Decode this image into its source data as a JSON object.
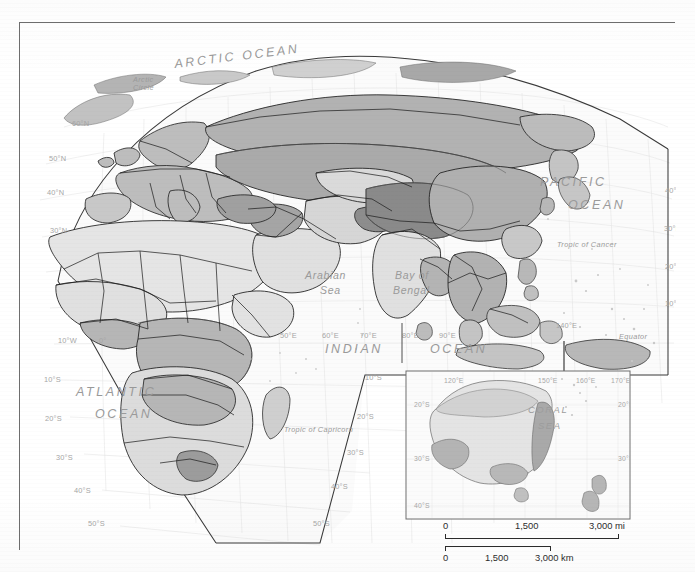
{
  "map": {
    "title": "",
    "projection_note": "",
    "frame": {
      "border_color": "#6e6e6e"
    },
    "ocean_labels": [
      {
        "id": "arctic-ocean",
        "text": "ARCTIC  OCEAN",
        "x": 155,
        "y": 45,
        "class": "ocean-major",
        "rotate": -7
      },
      {
        "id": "arctic-circle",
        "text": "Arctic",
        "x": 113,
        "y": 59,
        "class": "ocean-small",
        "rotate": 0
      },
      {
        "id": "arctic-circle2",
        "text": "Circle",
        "x": 113,
        "y": 67,
        "class": "ocean-small",
        "rotate": 0
      },
      {
        "id": "pacific-ocean",
        "text": "PACIFIC",
        "x": 520,
        "y": 163,
        "class": "ocean-major",
        "rotate": 0
      },
      {
        "id": "pacific-ocean2",
        "text": "OCEAN",
        "x": 548,
        "y": 186,
        "class": "ocean-major",
        "rotate": 0
      },
      {
        "id": "arabian-sea",
        "text": "Arabian",
        "x": 285,
        "y": 256,
        "class": "ocean-sea",
        "rotate": 0
      },
      {
        "id": "arabian-sea2",
        "text": "Sea",
        "x": 300,
        "y": 271,
        "class": "ocean-sea",
        "rotate": 0
      },
      {
        "id": "bay-of-bengal",
        "text": "Bay of",
        "x": 375,
        "y": 256,
        "class": "ocean-sea",
        "rotate": 0
      },
      {
        "id": "bay-of-bengal2",
        "text": "Bengal",
        "x": 373,
        "y": 271,
        "class": "ocean-sea",
        "rotate": 0
      },
      {
        "id": "indian-ocean",
        "text": "INDIAN",
        "x": 305,
        "y": 330,
        "class": "ocean-major",
        "rotate": 0
      },
      {
        "id": "indian-ocean2",
        "text": "OCEAN",
        "x": 410,
        "y": 330,
        "class": "ocean-major",
        "rotate": 0
      },
      {
        "id": "atlantic-ocean",
        "text": "ATLANTIC",
        "x": 56,
        "y": 373,
        "class": "ocean-major",
        "rotate": 0
      },
      {
        "id": "atlantic-ocean2",
        "text": "OCEAN",
        "x": 75,
        "y": 395,
        "class": "ocean-major",
        "rotate": 0
      },
      {
        "id": "tropic-of-cancer",
        "text": "Tropic of Cancer",
        "x": 537,
        "y": 224,
        "class": "ocean-small",
        "rotate": 0
      },
      {
        "id": "tropic-of-capricorn",
        "text": "Tropic of Capricorn",
        "x": 264,
        "y": 409,
        "class": "ocean-small",
        "rotate": 0
      },
      {
        "id": "equator",
        "text": "Equator",
        "x": 599,
        "y": 316,
        "class": "ocean-small",
        "rotate": 0
      }
    ],
    "latitude_labels_left": [
      {
        "text": "60°N",
        "x": 52,
        "y": 103
      },
      {
        "text": "50°N",
        "x": 29,
        "y": 138
      },
      {
        "text": "40°N",
        "x": 27,
        "y": 172
      },
      {
        "text": "30°N",
        "x": 30,
        "y": 210
      },
      {
        "text": "10°S",
        "x": 24,
        "y": 359
      },
      {
        "text": "20°S",
        "x": 25,
        "y": 398
      },
      {
        "text": "30°S",
        "x": 36,
        "y": 437
      },
      {
        "text": "40°S",
        "x": 54,
        "y": 470
      },
      {
        "text": "50°S",
        "x": 68,
        "y": 503
      }
    ],
    "latitude_labels_mid": [
      {
        "text": "10°S",
        "x": 345,
        "y": 357
      },
      {
        "text": "20°S",
        "x": 337,
        "y": 396
      },
      {
        "text": "30°S",
        "x": 327,
        "y": 432
      },
      {
        "text": "40°S",
        "x": 311,
        "y": 466
      },
      {
        "text": "50°S",
        "x": 293,
        "y": 503
      }
    ],
    "latitude_labels_right": [
      {
        "text": "40°N",
        "x": 645,
        "y": 170
      },
      {
        "text": "30°N",
        "x": 644,
        "y": 208
      },
      {
        "text": "20°N",
        "x": 645,
        "y": 246
      },
      {
        "text": "10°N",
        "x": 645,
        "y": 283
      },
      {
        "text": "0°",
        "x": 658,
        "y": 317
      }
    ],
    "longitude_labels": [
      {
        "text": "10°W",
        "x": 38,
        "y": 320
      },
      {
        "text": "0°",
        "x": 79,
        "y": 320
      },
      {
        "text": "50°E",
        "x": 260,
        "y": 315
      },
      {
        "text": "60°E",
        "x": 302,
        "y": 315
      },
      {
        "text": "70°E",
        "x": 340,
        "y": 315
      },
      {
        "text": "80°E",
        "x": 382,
        "y": 315
      },
      {
        "text": "90°E",
        "x": 419,
        "y": 315
      },
      {
        "text": "140°E",
        "x": 536,
        "y": 305
      }
    ]
  },
  "inset": {
    "name": "australia-new-zealand-inset",
    "sea_label_line1": "CORAL",
    "sea_label_line2": "SEA",
    "lat_labels": [
      {
        "text": "20°S",
        "side": "left",
        "x": 8,
        "y": 36
      },
      {
        "text": "30°S",
        "side": "left",
        "x": 8,
        "y": 90
      },
      {
        "text": "40°S",
        "side": "left",
        "x": 8,
        "y": 137
      },
      {
        "text": "20°S",
        "side": "right",
        "x": 212,
        "y": 36
      },
      {
        "text": "30°S",
        "side": "right",
        "x": 212,
        "y": 90
      }
    ],
    "lon_labels_top": [
      {
        "text": "120°E",
        "x": 38,
        "y": 12
      },
      {
        "text": "150°E",
        "x": 132,
        "y": 12
      },
      {
        "text": "160°E",
        "x": 170,
        "y": 12
      },
      {
        "text": "170°E",
        "x": 205,
        "y": 12
      }
    ],
    "lon_labels_bottom": [
      {
        "text": "110°E",
        "x": 18,
        "y": 160
      },
      {
        "text": "120°E",
        "x": 48,
        "y": 160
      },
      {
        "text": "130°E",
        "x": 79,
        "y": 160
      },
      {
        "text": "140°E",
        "x": 110,
        "y": 160
      },
      {
        "text": "150°E",
        "x": 141,
        "y": 160
      },
      {
        "text": "160°E",
        "x": 172,
        "y": 160
      },
      {
        "text": "180°",
        "x": 214,
        "y": 160
      }
    ]
  },
  "scalebar": {
    "miles": {
      "zero": "0",
      "mid": "1,500",
      "end": "3,000 mi"
    },
    "kilometers": {
      "zero": "0",
      "mid": "1,500",
      "end": "3,000 km"
    }
  },
  "palette": {
    "ocean": "#fbfbfb",
    "land_lightest": "#e9e9e9",
    "land_light": "#d8d8d8",
    "land_medium": "#bdbdbd",
    "land_dark": "#a3a3a3",
    "land_darkest": "#8d8d8d",
    "country_border": "#1d1d1d",
    "class_border": "#555555",
    "graticule": "#dcdcdc",
    "frame": "#6e6e6e",
    "label_grey": "#9a9a9a"
  }
}
